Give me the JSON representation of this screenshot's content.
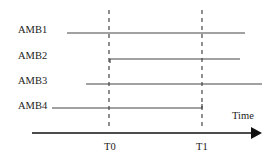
{
  "diagram": {
    "signals": [
      {
        "label": "AMB1",
        "start": "before",
        "end": "after"
      },
      {
        "label": "AMB2",
        "start": "T0",
        "end": "after"
      },
      {
        "label": "AMB3",
        "start": "before",
        "end": "after"
      },
      {
        "label": "AMB4",
        "start": "before",
        "end": "T1"
      }
    ],
    "markers": [
      {
        "label": "T0"
      },
      {
        "label": "T1"
      }
    ],
    "axis_label": "Time"
  }
}
